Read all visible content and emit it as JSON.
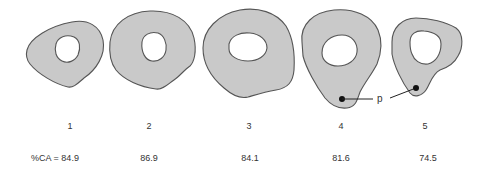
{
  "figure": {
    "shapes": [
      {
        "id": "1",
        "label": "1",
        "value": "%CA = 84.9"
      },
      {
        "id": "2",
        "label": "2",
        "value": "86.9"
      },
      {
        "id": "3",
        "label": "3",
        "value": "84.1"
      },
      {
        "id": "4",
        "label": "4",
        "value": "81.6"
      },
      {
        "id": "5",
        "label": "5",
        "value": "74.5"
      }
    ],
    "annotation": {
      "label": "p"
    },
    "colors": {
      "fill": "#c9c9c9",
      "outline": "#555555",
      "marker": "#111111"
    }
  }
}
